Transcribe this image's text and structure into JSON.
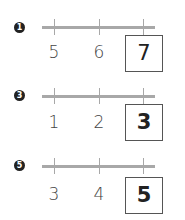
{
  "problems": [
    {
      "number": "1",
      "labels": [
        "5",
        "6"
      ],
      "answer": "7"
    },
    {
      "number": "3",
      "labels": [
        "1",
        "2"
      ],
      "answer": "3"
    },
    {
      "number": "5",
      "labels": [
        "3",
        "4"
      ],
      "answer": "5"
    }
  ],
  "colors": {
    "line": "#a8a8a8",
    "badge": "#222222",
    "box_border": "#555555"
  }
}
